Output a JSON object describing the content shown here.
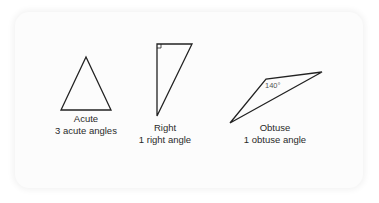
{
  "diagram": {
    "triangles": [
      {
        "name": "Acute",
        "description": "3 acute angles",
        "points": "86,57 61,110 111,110"
      },
      {
        "name": "Right",
        "description": "1 right angle",
        "points": "157,44 192,44 157,116",
        "right_angle_marker": "157,48 161,48 161,44"
      },
      {
        "name": "Obtuse",
        "description": "1 obtuse angle",
        "points": "230,123 266,79 322,72",
        "angle_label": "140°"
      }
    ],
    "colors": {
      "stroke": "#222222",
      "text": "#2a2a2a",
      "card_background": "#fcfcfc"
    }
  }
}
